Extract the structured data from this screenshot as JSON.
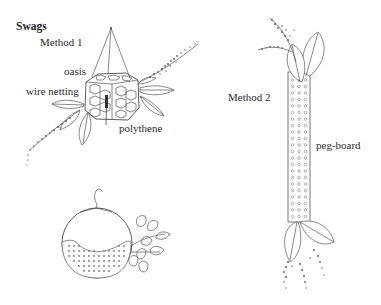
{
  "figure": {
    "title": "Swags",
    "method1": {
      "heading": "Method 1",
      "labels": {
        "oasis": "oasis",
        "wire_netting": "wire netting",
        "polythene": "polythene"
      }
    },
    "method2": {
      "heading": "Method 2",
      "labels": {
        "peg_board": "peg-board"
      }
    },
    "colors": {
      "background": "#ffffff",
      "ink": "#555555",
      "text": "#2b2b2b"
    }
  }
}
